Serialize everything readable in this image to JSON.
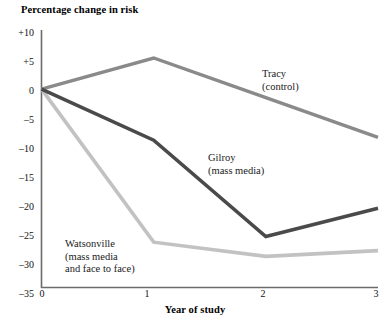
{
  "chart_data": {
    "type": "line",
    "title": "Percentage change in risk",
    "xlabel": "Year of study",
    "ylabel": "Percentage change in risk",
    "x": [
      0,
      1,
      2,
      3
    ],
    "xticklabels": [
      "0",
      "1",
      "2",
      "3"
    ],
    "yticklabels": [
      "+10",
      "+5",
      "0",
      "–5",
      "–10",
      "–15",
      "–20",
      "–25",
      "–30",
      "–35"
    ],
    "ytickvalues": [
      10,
      5,
      0,
      -5,
      -10,
      -15,
      -20,
      -25,
      -30,
      -35
    ],
    "xlim": [
      0,
      3
    ],
    "ylim": [
      -35,
      10
    ],
    "grid": false,
    "legend": "inline-annotations",
    "series": [
      {
        "name": "Tracy",
        "label_line1": "Tracy",
        "label_line2": "(control)",
        "color": "#8a8a8a",
        "values": [
          0,
          5.5,
          -1.5,
          -8.5
        ]
      },
      {
        "name": "Gilroy",
        "label_line1": "Gilroy",
        "label_line2": "(mass media)",
        "color": "#4a4a4a",
        "values": [
          0,
          -9,
          -26,
          -21
        ]
      },
      {
        "name": "Watsonville",
        "label_line1": "Watsonville",
        "label_line2": "(mass media",
        "label_line3": "and face to face)",
        "color": "#c2c2c2",
        "values": [
          0,
          -27,
          -29.5,
          -28.5
        ]
      }
    ]
  },
  "annotations": {
    "tracy": {
      "line1": "Tracy",
      "line2": "(control)"
    },
    "gilroy": {
      "line1": "Gilroy",
      "line2": "(mass media)"
    },
    "watsonville": {
      "line1": "Watsonville",
      "line2": "(mass media",
      "line3": "and face to face)"
    }
  },
  "colors": {
    "axis": "#6b6b6b",
    "text": "#000000",
    "tracy": "#8a8a8a",
    "gilroy": "#4a4a4a",
    "watsonville": "#c2c2c2",
    "background": "#ffffff"
  }
}
